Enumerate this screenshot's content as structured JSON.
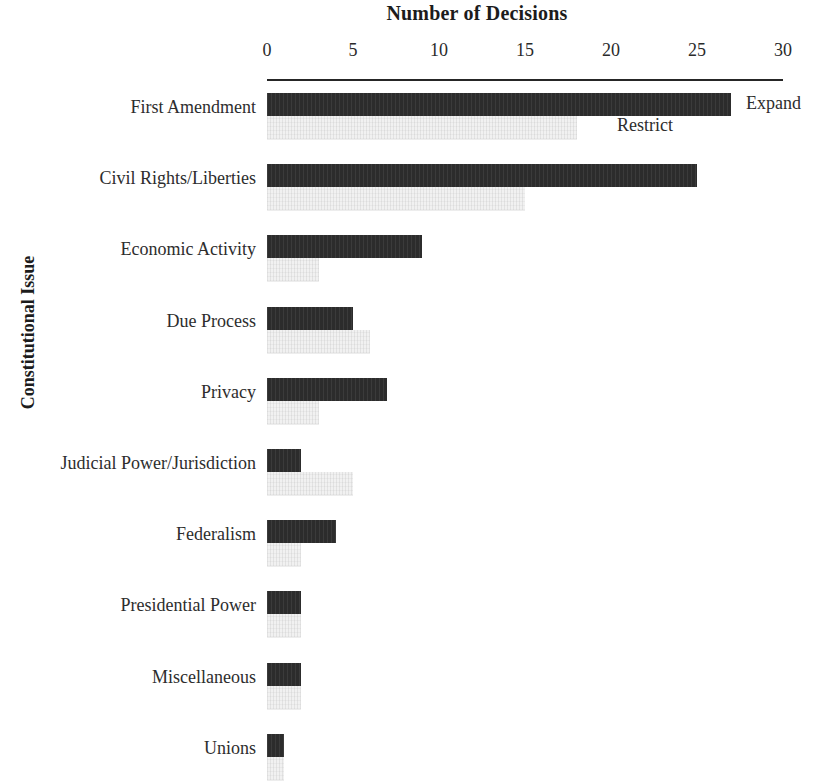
{
  "chart_data": {
    "type": "bar",
    "orientation": "horizontal",
    "title": "Number of Decisions",
    "xlabel": "Number of Decisions",
    "ylabel": "Constitutional Issue",
    "xlim": [
      0,
      30
    ],
    "xticks": [
      0,
      5,
      10,
      15,
      20,
      25,
      30
    ],
    "grid": false,
    "legend_position": "inline-first-row",
    "categories": [
      "First Amendment",
      "Civil Rights/Liberties",
      "Economic Activity",
      "Due Process",
      "Privacy",
      "Judicial Power/Jurisdiction",
      "Federalism",
      "Presidential Power",
      "Miscellaneous",
      "Unions"
    ],
    "series": [
      {
        "name": "Expand",
        "color": "#2c2c2c",
        "values": [
          27,
          25,
          9,
          5,
          7,
          2,
          4,
          2,
          2,
          1
        ]
      },
      {
        "name": "Restrict",
        "color": "#f1f1f1",
        "values": [
          18,
          15,
          3,
          6,
          3,
          5,
          2,
          2,
          2,
          1
        ]
      }
    ]
  },
  "axis": {
    "tick_labels": [
      "0",
      "5",
      "10",
      "15",
      "20",
      "25",
      "30"
    ],
    "y_title": "Constitutional Issue"
  },
  "legend": {
    "expand": "Expand",
    "restrict": "Restrict"
  }
}
